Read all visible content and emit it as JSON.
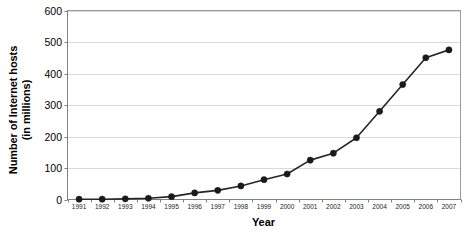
{
  "chart_data": {
    "type": "line",
    "title": "",
    "xlabel": "Year",
    "ylabel": "Number of Internet hosts (in millions)",
    "ylabel_lines": [
      "Number of Internet hosts",
      "(in millions)"
    ],
    "categories": [
      "1991",
      "1992",
      "1993",
      "1994",
      "1995",
      "1996",
      "1997",
      "1998",
      "1999",
      "2000",
      "2001",
      "2002",
      "2003",
      "2004",
      "2005",
      "2006",
      "2007"
    ],
    "values": [
      1,
      1,
      2,
      4,
      9,
      21,
      29,
      43,
      63,
      81,
      125,
      147,
      196,
      280,
      365,
      450,
      475
    ],
    "series": [
      {
        "name": "Internet hosts",
        "values": [
          1,
          1,
          2,
          4,
          9,
          21,
          29,
          43,
          63,
          81,
          125,
          147,
          196,
          280,
          365,
          450,
          475
        ]
      }
    ],
    "ylim": [
      0,
      600
    ],
    "ytick_step": 100,
    "yticks": [
      0,
      100,
      200,
      300,
      400,
      500,
      600
    ],
    "ytick_labels": [
      "0",
      "100",
      "200",
      "300",
      "400",
      "500",
      "600"
    ],
    "grid": true,
    "grid_axis": "y",
    "legend": false,
    "legend_position": "none",
    "marker": "filled-circle",
    "colors": {
      "line": "#262626",
      "marker": "#1a1a1a",
      "gridline": "#d9d9d9",
      "axis": "#9a9a9a",
      "background": "#ffffff",
      "text": "#000000"
    }
  }
}
